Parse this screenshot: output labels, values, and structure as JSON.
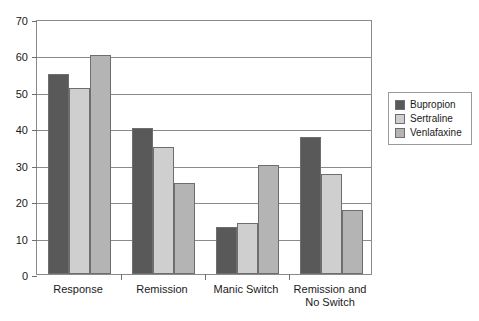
{
  "chart_data": {
    "type": "bar",
    "title": "",
    "subtitle": "",
    "xlabel": "",
    "ylabel": "",
    "ylim": [
      0,
      70
    ],
    "yticks": [
      0,
      10,
      20,
      30,
      40,
      50,
      60,
      70
    ],
    "grid": true,
    "legend_position": "right",
    "categories": [
      "Response",
      "Remission",
      "Manic Switch",
      "Remission and\nNo Switch"
    ],
    "category_lines": [
      [
        "Response"
      ],
      [
        "Remission"
      ],
      [
        "Manic Switch"
      ],
      [
        "Remission and",
        "No Switch"
      ]
    ],
    "series": [
      {
        "name": "Bupropion",
        "color": "#595959",
        "values": [
          55,
          40,
          13,
          37.5
        ]
      },
      {
        "name": "Sertraline",
        "color": "#cfcfcf",
        "values": [
          51,
          35,
          14,
          27.5
        ]
      },
      {
        "name": "Venlafaxine",
        "color": "#b4b4b4",
        "values": [
          60,
          25,
          30,
          17.5
        ]
      }
    ]
  },
  "legend": {
    "items": [
      {
        "label": "Bupropion",
        "color": "#595959"
      },
      {
        "label": "Sertraline",
        "color": "#cfcfcf"
      },
      {
        "label": "Venlafaxine",
        "color": "#b4b4b4"
      }
    ]
  },
  "axis": {
    "y_tick_labels": [
      "0",
      "10",
      "20",
      "30",
      "40",
      "50",
      "60",
      "70"
    ]
  }
}
